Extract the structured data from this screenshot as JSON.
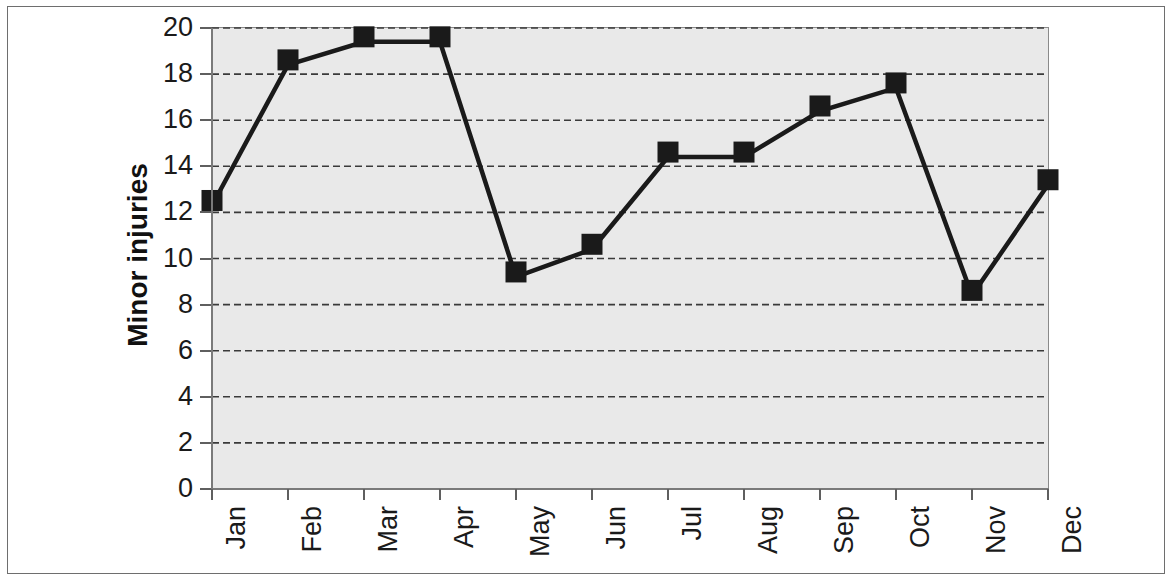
{
  "chart_data": {
    "type": "line",
    "title": "",
    "xlabel": "",
    "ylabel": "Minor injuries",
    "categories": [
      "Jan",
      "Feb",
      "Mar",
      "Apr",
      "May",
      "Jun",
      "Jul",
      "Aug",
      "Sep",
      "Oct",
      "Nov",
      "Dec"
    ],
    "values": [
      12.3,
      18.4,
      19.4,
      19.4,
      9.2,
      10.4,
      14.4,
      14.4,
      16.4,
      17.4,
      8.4,
      13.2
    ],
    "series": [
      {
        "name": "Minor injuries",
        "values": [
          12.3,
          18.4,
          19.4,
          19.4,
          9.2,
          10.4,
          14.4,
          14.4,
          16.4,
          17.4,
          8.4,
          13.2
        ]
      }
    ],
    "ylim": [
      0,
      20
    ],
    "ytick_labels": [
      "0",
      "2",
      "4",
      "6",
      "8",
      "10",
      "12",
      "14",
      "16",
      "18",
      "20"
    ],
    "ytick_values": [
      0,
      2,
      4,
      6,
      8,
      10,
      12,
      14,
      16,
      18,
      20
    ],
    "grid": "horizontal-dashed",
    "legend": "none",
    "marker": "filled-square",
    "line_color": "#1a1a1a",
    "marker_color": "#1a1a1a",
    "plot_background": "#e9e9e9",
    "figure_background": "#ffffff",
    "xtick_label_rotation": -90
  },
  "axis": {
    "y_title": "Minor injuries"
  }
}
